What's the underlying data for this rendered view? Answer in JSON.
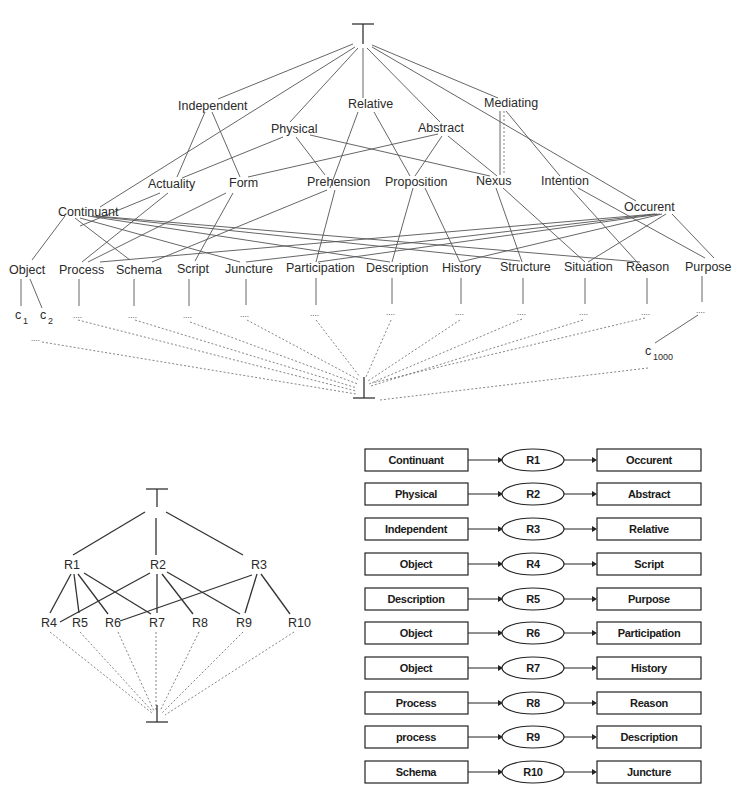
{
  "upper_lattice": {
    "top_symbol": "⊤",
    "bottom_symbol": "⊥",
    "level1": [
      "Independent",
      "Relative",
      "Mediating"
    ],
    "level2": [
      "Physical",
      "Abstract"
    ],
    "level3": [
      "Actuality",
      "Form",
      "Prehension",
      "Proposition",
      "Nexus",
      "Intention"
    ],
    "level4": [
      "Continuant",
      "Occurent"
    ],
    "level5": [
      "Object",
      "Process",
      "Schema",
      "Script",
      "Juncture",
      "Participation",
      "Description",
      "History",
      "Structure",
      "Situation",
      "Reason",
      "Purpose"
    ],
    "instances": {
      "c1": "c",
      "c1_sub": "1",
      "c2": "c",
      "c2_sub": "2",
      "c1000": "c",
      "c1000_sub": "1000",
      "ellipsis": "...."
    }
  },
  "lower_lattice": {
    "top_symbol": "⊤",
    "bottom_symbol": "⊥",
    "level1": [
      "R1",
      "R2",
      "R3"
    ],
    "level2": [
      "R4",
      "R5",
      "R6",
      "R7",
      "R8",
      "R9",
      "R10"
    ]
  },
  "relations": [
    {
      "source": "Continuant",
      "relation": "R1",
      "target": "Occurent"
    },
    {
      "source": "Physical",
      "relation": "R2",
      "target": "Abstract"
    },
    {
      "source": "Independent",
      "relation": "R3",
      "target": "Relative"
    },
    {
      "source": "Object",
      "relation": "R4",
      "target": "Script"
    },
    {
      "source": "Description",
      "relation": "R5",
      "target": "Purpose"
    },
    {
      "source": "Object",
      "relation": "R6",
      "target": "Participation"
    },
    {
      "source": "Object",
      "relation": "R7",
      "target": "History"
    },
    {
      "source": "Process",
      "relation": "R8",
      "target": "Reason"
    },
    {
      "source": "process",
      "relation": "R9",
      "target": "Description"
    },
    {
      "source": "Schema",
      "relation": "R10",
      "target": "Juncture"
    }
  ]
}
